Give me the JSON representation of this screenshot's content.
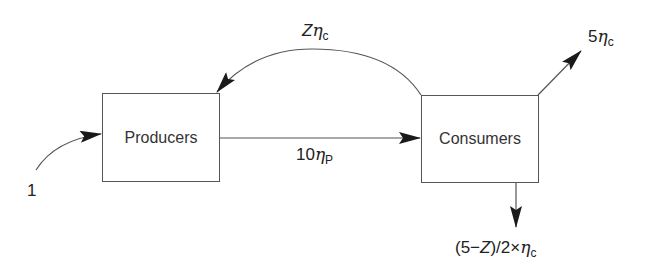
{
  "diagram": {
    "type": "flow",
    "nodes": [
      {
        "id": "producers",
        "label": "Producers"
      },
      {
        "id": "consumers",
        "label": "Consumers"
      }
    ],
    "edges": [
      {
        "id": "input",
        "from": "external",
        "to": "producers",
        "label": "1"
      },
      {
        "id": "producers-to-consumers",
        "from": "producers",
        "to": "consumers",
        "label_prefix": "10",
        "label_symbol": "η",
        "label_sub": "P"
      },
      {
        "id": "consumers-to-producers",
        "from": "consumers",
        "to": "producers",
        "label_prefix": "Z",
        "label_symbol": "η",
        "label_sub": "c"
      },
      {
        "id": "consumers-output-up",
        "from": "consumers",
        "to": "external",
        "label_prefix": "5",
        "label_symbol": "η",
        "label_sub": "c"
      },
      {
        "id": "consumers-output-down",
        "from": "consumers",
        "to": "external",
        "label_prefix": "(5−",
        "label_var": "Z",
        "label_mid": ")/2×",
        "label_symbol": "η",
        "label_sub": "c"
      }
    ],
    "colors": {
      "line": "#555555",
      "arrowhead": "#1a1a1a",
      "text": "#222222"
    }
  }
}
